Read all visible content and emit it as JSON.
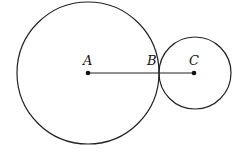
{
  "diagram": {
    "stroke_color": "#222222",
    "background": "#ffffff",
    "circles": [
      {
        "name": "circle-A",
        "cx": 88,
        "cy": 73,
        "r": 71
      },
      {
        "name": "circle-C",
        "cx": 195,
        "cy": 73,
        "r": 36
      }
    ],
    "segment": {
      "from": "A",
      "to": "C",
      "x1": 88,
      "y1": 73,
      "x2": 194,
      "y2": 73
    },
    "points": [
      {
        "label": "A",
        "x": 88,
        "y": 73,
        "dot": true,
        "label_x": 83,
        "label_y": 65
      },
      {
        "label": "B",
        "x": 159,
        "y": 73,
        "dot": false,
        "label_x": 147,
        "label_y": 65
      },
      {
        "label": "C",
        "x": 194,
        "y": 73,
        "dot": true,
        "label_x": 189,
        "label_y": 65
      }
    ]
  }
}
